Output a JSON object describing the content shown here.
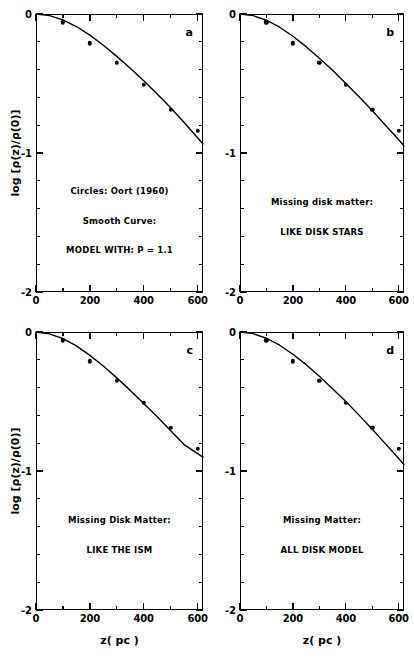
{
  "figure": {
    "background": "#ffffff",
    "ink": "#000000",
    "axis_title_x": "z( pc )",
    "axis_title_y": "log [ρ(z)/ρ(0)]"
  },
  "axes": {
    "x": {
      "min": 0,
      "max": 620,
      "major_ticks": [
        0,
        200,
        400,
        600
      ],
      "major_labels": [
        "0",
        "200",
        "400",
        "600"
      ],
      "minor_ticks": [
        100,
        300,
        500
      ],
      "label": "z( pc )"
    },
    "y": {
      "min": -2,
      "max": 0,
      "major_ticks": [
        0,
        -1,
        -2
      ],
      "major_labels": [
        "0",
        "-1",
        "-2"
      ],
      "minor_ticks": [
        -0.2,
        -0.4,
        -0.6,
        -0.8,
        -1.2,
        -1.4,
        -1.6,
        -1.8
      ],
      "label": "log [ρ(z)/ρ(0)]"
    }
  },
  "chart_data": {
    "type": "scatter",
    "title": "",
    "xlabel": "z( pc )",
    "ylabel": "log [ρ(z)/ρ(0)]",
    "xlim": [
      0,
      620
    ],
    "ylim": [
      -2,
      0
    ],
    "grid": false,
    "legend": "none",
    "panels": [
      {
        "id": "a",
        "letter": "a",
        "annotations": [
          "Circles: Oort (1960)",
          "Smooth Curve:",
          "MODEL WITH: P = 1.1"
        ],
        "series": [
          {
            "name": "Circles: Oort (1960)",
            "type": "scatter",
            "marker": "filled-circle",
            "x": [
              100,
              200,
              300,
              400,
              500,
              600
            ],
            "y": [
              -0.06,
              -0.21,
              -0.35,
              -0.51,
              -0.69,
              -0.84
            ]
          },
          {
            "name": "MODEL WITH: P = 1.1",
            "type": "line",
            "x": [
              0,
              50,
              100,
              150,
              200,
              250,
              300,
              350,
              400,
              450,
              500,
              550,
              600,
              620
            ],
            "y": [
              0.0,
              -0.012,
              -0.042,
              -0.09,
              -0.152,
              -0.225,
              -0.305,
              -0.39,
              -0.48,
              -0.575,
              -0.675,
              -0.78,
              -0.89,
              -0.935
            ]
          }
        ]
      },
      {
        "id": "b",
        "letter": "b",
        "annotations": [
          "Missing disk matter:",
          "LIKE DISK STARS"
        ],
        "series": [
          {
            "name": "Circles: Oort (1960)",
            "type": "scatter",
            "marker": "filled-circle",
            "x": [
              100,
              200,
              300,
              400,
              500,
              600
            ],
            "y": [
              -0.06,
              -0.21,
              -0.35,
              -0.51,
              -0.69,
              -0.84
            ]
          },
          {
            "name": "Missing disk matter: LIKE DISK STARS",
            "type": "line",
            "x": [
              0,
              50,
              100,
              150,
              200,
              250,
              300,
              350,
              400,
              450,
              500,
              550,
              600,
              620
            ],
            "y": [
              0.0,
              -0.012,
              -0.045,
              -0.095,
              -0.16,
              -0.235,
              -0.318,
              -0.405,
              -0.5,
              -0.595,
              -0.695,
              -0.8,
              -0.905,
              -0.95
            ]
          }
        ]
      },
      {
        "id": "c",
        "letter": "c",
        "annotations": [
          "Missing Disk Matter:",
          "LIKE THE ISM"
        ],
        "series": [
          {
            "name": "Circles: Oort (1960)",
            "type": "scatter",
            "marker": "filled-circle",
            "x": [
              100,
              200,
              300,
              400,
              500,
              600
            ],
            "y": [
              -0.06,
              -0.21,
              -0.35,
              -0.51,
              -0.69,
              -0.84
            ]
          },
          {
            "name": "Missing Disk Matter: LIKE THE ISM",
            "type": "line",
            "x": [
              0,
              50,
              100,
              150,
              200,
              250,
              300,
              350,
              400,
              450,
              500,
              550,
              600,
              620
            ],
            "y": [
              0.0,
              -0.013,
              -0.048,
              -0.1,
              -0.168,
              -0.245,
              -0.33,
              -0.42,
              -0.515,
              -0.61,
              -0.71,
              -0.81,
              -0.875,
              -0.9
            ]
          }
        ]
      },
      {
        "id": "d",
        "letter": "d",
        "annotations": [
          "Missing Matter:",
          "ALL DISK MODEL"
        ],
        "series": [
          {
            "name": "Circles: Oort (1960)",
            "type": "scatter",
            "marker": "filled-circle",
            "x": [
              100,
              200,
              300,
              400,
              500,
              600
            ],
            "y": [
              -0.06,
              -0.21,
              -0.35,
              -0.51,
              -0.69,
              -0.84
            ]
          },
          {
            "name": "Missing Matter: ALL DISK MODEL",
            "type": "line",
            "x": [
              0,
              50,
              100,
              150,
              200,
              250,
              300,
              350,
              400,
              450,
              500,
              550,
              600,
              620
            ],
            "y": [
              0.0,
              -0.012,
              -0.045,
              -0.095,
              -0.16,
              -0.235,
              -0.318,
              -0.408,
              -0.5,
              -0.598,
              -0.7,
              -0.805,
              -0.91,
              -0.955
            ]
          }
        ]
      }
    ]
  },
  "layout": {
    "panels": [
      {
        "id": "a",
        "left": 36,
        "top": 14,
        "width": 167,
        "height": 278
      },
      {
        "id": "b",
        "left": 240,
        "top": 14,
        "width": 164,
        "height": 278
      },
      {
        "id": "c",
        "left": 36,
        "top": 332,
        "width": 167,
        "height": 278
      },
      {
        "id": "d",
        "left": 240,
        "top": 332,
        "width": 164,
        "height": 278
      }
    ]
  }
}
